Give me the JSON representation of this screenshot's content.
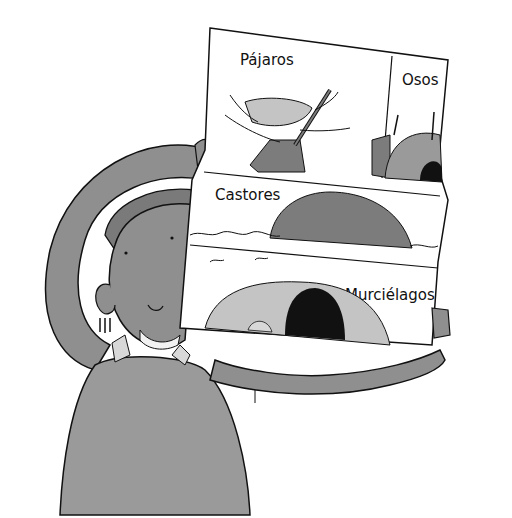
{
  "illustration": {
    "description": "Child holding up a poster of animal homes",
    "colors": {
      "background": "#ffffff",
      "skin": "#8f8f8f",
      "sweater": "#9a9a9a",
      "hair": "#7a7a7a",
      "outline": "#111111",
      "cave_light": "#c4c4c4",
      "lodge": "#7c7c7c"
    },
    "poster": {
      "panels": [
        {
          "label": "Pájaros",
          "subject": "bird nest in tree"
        },
        {
          "label": "Osos",
          "subject": "bear den"
        },
        {
          "label": "Castores",
          "subject": "beaver lodge in water"
        },
        {
          "label": "Murciélagos",
          "subject": "bat cave"
        }
      ]
    }
  }
}
